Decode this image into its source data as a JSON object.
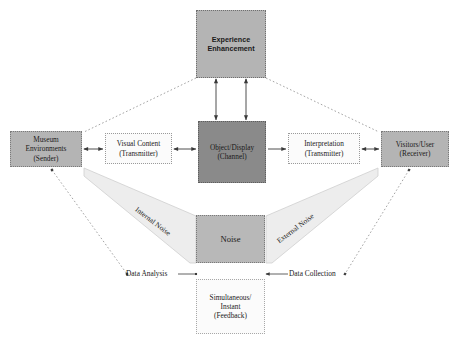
{
  "diagram": {
    "background": "#ffffff",
    "nodes": {
      "experience": {
        "label": "Experience\nEnhancement",
        "fill": "#b4b4b4"
      },
      "museum": {
        "label": "Museum\nEnvironments\n(Sender)",
        "fill": "#b4b4b4"
      },
      "visual": {
        "label": "Visual Content\n(Transmitter)",
        "fill": "#fbfbfb"
      },
      "object": {
        "label": "Object/Display\n(Channel)",
        "fill": "#8a8a8a"
      },
      "interpretation": {
        "label": "Interpretation\n(Transmitter)",
        "fill": "#fbfbfb"
      },
      "visitors": {
        "label": "Visitors/User\n(Receiver)",
        "fill": "#b4b4b4"
      },
      "noise": {
        "label": "Noise",
        "fill": "#b8b8b8"
      },
      "feedback": {
        "label": "Simultaneous/\nInstant\n(Feedback)",
        "fill": "#fbfbfb"
      }
    },
    "edge_labels": {
      "internal_noise": "Internal Noise",
      "external_noise": "External Noise",
      "data_analysis": "Data Analysis",
      "data_collection": "Data Collection"
    },
    "colors": {
      "stroke": "#3a3a3a",
      "dotted_stroke": "#8a8a8a",
      "funnel_fill": "#ededed",
      "funnel_stroke": "#c9c9c9"
    }
  }
}
